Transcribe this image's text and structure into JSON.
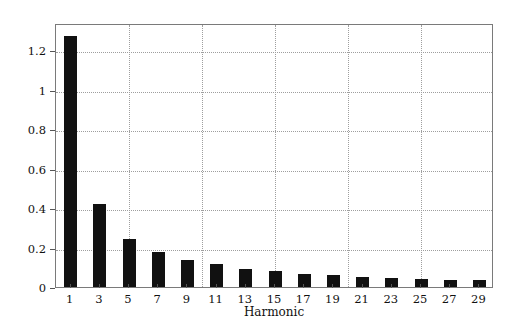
{
  "chart_data": {
    "type": "bar",
    "title": "",
    "xlabel": "Harmonic",
    "ylabel": "Amplitude of force",
    "categories": [
      "1",
      "3",
      "5",
      "7",
      "9",
      "11",
      "13",
      "15",
      "17",
      "19",
      "21",
      "23",
      "25",
      "27",
      "29"
    ],
    "values": [
      1.27,
      0.42,
      0.245,
      0.175,
      0.135,
      0.115,
      0.09,
      0.08,
      0.065,
      0.06,
      0.05,
      0.045,
      0.04,
      0.035,
      0.035
    ],
    "xtick_labels": [
      "1",
      "3",
      "5",
      "7",
      "9",
      "11",
      "13",
      "15",
      "17",
      "19",
      "21",
      "23",
      "25",
      "27",
      "29"
    ],
    "ytick_labels": [
      "0",
      "0.2",
      "0.4",
      "0.6",
      "0.8",
      "1",
      "1.2"
    ],
    "ytick_values": [
      0,
      0.2,
      0.4,
      0.6,
      0.8,
      1,
      1.2
    ],
    "ylim": [
      0,
      1.337
    ],
    "xlim": [
      0,
      30
    ],
    "grid": true,
    "grid_style": "dotted",
    "legend": "none",
    "bar_color": "#111111",
    "grid_color": "#9e9e9e",
    "axis_color": "#7a7a7a"
  }
}
